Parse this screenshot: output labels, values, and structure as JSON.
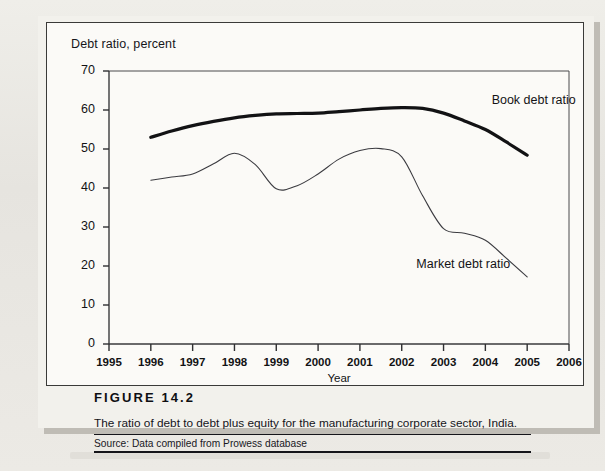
{
  "figure": {
    "number_label": "FIGURE 14.2",
    "description": "The ratio of debt to debt plus equity for the manufacturing corporate sector, India.",
    "source": "Source: Data compiled from Prowess database"
  },
  "chart_data": {
    "type": "line",
    "title": "Debt ratio, percent",
    "xlabel": "Year",
    "ylabel": "Debt ratio, percent",
    "xlim": [
      1995,
      2006
    ],
    "ylim": [
      0,
      70
    ],
    "yticks": [
      0,
      10,
      20,
      30,
      40,
      50,
      60,
      70
    ],
    "xticks": [
      1995,
      1996,
      1997,
      1998,
      1999,
      2000,
      2001,
      2002,
      2003,
      2004,
      2005,
      2006
    ],
    "grid": false,
    "legend_position": "inline-annotation",
    "series": [
      {
        "name": "Book debt ratio",
        "color": "#121214",
        "width": 3.2,
        "x": [
          1996,
          1996.5,
          1997,
          1997.5,
          1998,
          1998.5,
          1999,
          1999.5,
          2000,
          2000.5,
          2001,
          2001.5,
          2002,
          2002.5,
          2003,
          2003.5,
          2004,
          2004.5,
          2005
        ],
        "values": [
          53.0,
          54.6,
          56.0,
          57.1,
          58.0,
          58.6,
          59.0,
          59.1,
          59.2,
          59.6,
          60.0,
          60.4,
          60.6,
          60.4,
          59.2,
          57.2,
          55.0,
          51.8,
          48.4
        ]
      },
      {
        "name": "Market debt ratio",
        "color": "#3b3b40",
        "width": 1.1,
        "x": [
          1996,
          1996.5,
          1997,
          1997.5,
          1998,
          1998.5,
          1999,
          1999.5,
          2000,
          2000.5,
          2001,
          2001.5,
          2002,
          2002.5,
          2003,
          2003.5,
          2004,
          2004.5,
          2005
        ],
        "values": [
          42.0,
          42.8,
          43.6,
          46.2,
          48.9,
          46.0,
          39.8,
          40.6,
          43.6,
          47.4,
          49.6,
          50.1,
          48.0,
          38.0,
          29.6,
          28.4,
          26.6,
          22.0,
          17.2
        ]
      }
    ],
    "annotations": [
      {
        "text": "Book debt ratio",
        "x": 2004.15,
        "y": 62.0
      },
      {
        "text": "Market debt ratio",
        "x": 2002.35,
        "y": 20.0
      }
    ]
  }
}
